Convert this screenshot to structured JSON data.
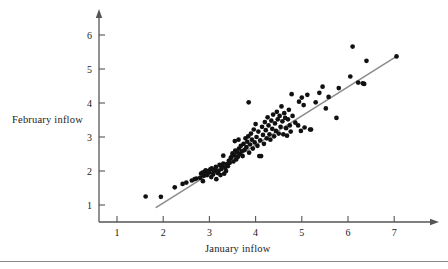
{
  "figure": {
    "title": "",
    "background_color": "#ffffff",
    "point_color": "#111111",
    "line_color": "#8c8c8c",
    "axis_color": "#555555"
  },
  "labels": {
    "ylabel": "February inflow",
    "xlabel": "January inflow"
  },
  "chart_data": {
    "type": "scatter",
    "title": "",
    "xlabel": "January inflow",
    "ylabel": "February inflow",
    "xlim": [
      0.6,
      7.35
    ],
    "ylim": [
      0.55,
      6.4
    ],
    "xticks": [
      1,
      2,
      3,
      4,
      5,
      6,
      7
    ],
    "yticks": [
      1,
      2,
      3,
      4,
      5,
      6
    ],
    "xticklabels": [
      "1",
      "2",
      "3",
      "4",
      "5",
      "6",
      "7"
    ],
    "yticklabels": [
      "1",
      "2",
      "3",
      "4",
      "5",
      "6"
    ],
    "grid": false,
    "legend": null,
    "series": [
      {
        "name": "inflow observations",
        "marker": "circle",
        "color": "#111111",
        "points": [
          [
            1.62,
            1.25
          ],
          [
            1.95,
            1.24
          ],
          [
            2.25,
            1.52
          ],
          [
            2.42,
            1.62
          ],
          [
            2.5,
            1.66
          ],
          [
            2.62,
            1.72
          ],
          [
            2.68,
            1.76
          ],
          [
            2.72,
            1.78
          ],
          [
            2.8,
            1.8
          ],
          [
            2.82,
            1.92
          ],
          [
            2.85,
            1.95
          ],
          [
            2.86,
            1.7
          ],
          [
            2.88,
            1.86
          ],
          [
            2.9,
            1.98
          ],
          [
            2.92,
            2.02
          ],
          [
            2.95,
            1.88
          ],
          [
            2.96,
            1.94
          ],
          [
            2.98,
            2.0
          ],
          [
            3.0,
            1.96
          ],
          [
            3.02,
            2.05
          ],
          [
            3.04,
            1.82
          ],
          [
            3.05,
            2.08
          ],
          [
            3.08,
            1.9
          ],
          [
            3.1,
            1.98
          ],
          [
            3.12,
            2.04
          ],
          [
            3.14,
            2.12
          ],
          [
            3.15,
            1.76
          ],
          [
            3.18,
            1.94
          ],
          [
            3.2,
            2.0
          ],
          [
            3.22,
            2.18
          ],
          [
            3.24,
            1.88
          ],
          [
            3.26,
            2.06
          ],
          [
            3.28,
            2.14
          ],
          [
            3.3,
            2.22
          ],
          [
            3.32,
            1.92
          ],
          [
            3.34,
            2.1
          ],
          [
            3.36,
            2.0
          ],
          [
            3.38,
            2.2
          ],
          [
            3.3,
            2.45
          ],
          [
            3.4,
            2.14
          ],
          [
            3.42,
            2.3
          ],
          [
            3.44,
            2.24
          ],
          [
            3.46,
            2.38
          ],
          [
            3.48,
            2.42
          ],
          [
            3.5,
            2.52
          ],
          [
            3.52,
            2.28
          ],
          [
            3.54,
            2.46
          ],
          [
            3.55,
            2.88
          ],
          [
            3.56,
            2.6
          ],
          [
            3.58,
            2.34
          ],
          [
            3.6,
            2.55
          ],
          [
            3.62,
            2.42
          ],
          [
            3.63,
            2.92
          ],
          [
            3.64,
            2.66
          ],
          [
            3.66,
            2.5
          ],
          [
            3.68,
            2.74
          ],
          [
            3.7,
            2.58
          ],
          [
            3.72,
            2.44
          ],
          [
            3.74,
            2.8
          ],
          [
            3.76,
            2.62
          ],
          [
            3.78,
            2.96
          ],
          [
            3.8,
            2.7
          ],
          [
            3.82,
            2.86
          ],
          [
            3.84,
            3.02
          ],
          [
            3.85,
            4.02
          ],
          [
            3.86,
            2.54
          ],
          [
            3.88,
            2.78
          ],
          [
            3.9,
            3.1
          ],
          [
            3.92,
            2.92
          ],
          [
            3.94,
            2.66
          ],
          [
            3.96,
            3.22
          ],
          [
            3.98,
            2.84
          ],
          [
            4.0,
            3.38
          ],
          [
            4.02,
            3.0
          ],
          [
            4.04,
            2.74
          ],
          [
            4.06,
            3.16
          ],
          [
            4.08,
            2.44
          ],
          [
            4.12,
            2.44
          ],
          [
            4.1,
            2.9
          ],
          [
            4.14,
            3.3
          ],
          [
            4.16,
            3.06
          ],
          [
            4.18,
            2.8
          ],
          [
            4.2,
            3.44
          ],
          [
            4.22,
            3.2
          ],
          [
            4.24,
            2.96
          ],
          [
            4.26,
            3.58
          ],
          [
            4.28,
            3.34
          ],
          [
            4.3,
            3.08
          ],
          [
            4.32,
            2.92
          ],
          [
            4.34,
            3.48
          ],
          [
            4.36,
            3.24
          ],
          [
            4.38,
            3.66
          ],
          [
            4.4,
            3.02
          ],
          [
            4.42,
            3.4
          ],
          [
            4.44,
            3.18
          ],
          [
            4.46,
            3.74
          ],
          [
            4.48,
            3.52
          ],
          [
            4.5,
            3.1
          ],
          [
            4.52,
            3.62
          ],
          [
            4.54,
            3.3
          ],
          [
            4.56,
            3.9
          ],
          [
            4.58,
            3.46
          ],
          [
            4.6,
            3.08
          ],
          [
            4.62,
            3.7
          ],
          [
            4.64,
            3.56
          ],
          [
            4.66,
            3.26
          ],
          [
            4.68,
            3.04
          ],
          [
            4.7,
            3.52
          ],
          [
            4.72,
            3.8
          ],
          [
            4.74,
            3.34
          ],
          [
            4.76,
            3.16
          ],
          [
            4.78,
            4.26
          ],
          [
            4.8,
            3.62
          ],
          [
            4.86,
            3.42
          ],
          [
            4.92,
            3.34
          ],
          [
            4.94,
            4.04
          ],
          [
            4.98,
            3.18
          ],
          [
            5.0,
            4.16
          ],
          [
            5.04,
            3.94
          ],
          [
            5.06,
            3.28
          ],
          [
            5.12,
            4.24
          ],
          [
            5.18,
            3.22
          ],
          [
            5.2,
            3.22
          ],
          [
            5.3,
            4.02
          ],
          [
            5.38,
            4.3
          ],
          [
            5.45,
            4.48
          ],
          [
            5.52,
            3.84
          ],
          [
            5.58,
            4.18
          ],
          [
            5.75,
            3.56
          ],
          [
            5.8,
            4.44
          ],
          [
            6.05,
            4.78
          ],
          [
            6.1,
            5.66
          ],
          [
            6.22,
            4.6
          ],
          [
            6.32,
            4.58
          ],
          [
            6.35,
            4.56
          ],
          [
            6.4,
            5.24
          ],
          [
            7.05,
            5.37
          ]
        ]
      }
    ],
    "annotations": [
      {
        "type": "regression-line",
        "name": "fit-line",
        "color": "#8c8c8c",
        "x_start": 1.85,
        "y_start": 0.93,
        "x_end": 7.05,
        "y_end": 5.37,
        "slope": 0.854,
        "intercept": -0.65
      }
    ]
  }
}
